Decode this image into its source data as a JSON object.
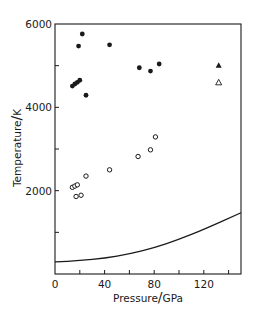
{
  "chart_data": {
    "type": "scatter",
    "title": "",
    "xlabel": "Pressure/GPa",
    "ylabel": "Temperature/K",
    "xlim": [
      0,
      150
    ],
    "ylim": [
      0,
      6000
    ],
    "x_ticks_major": [
      0,
      40,
      80,
      120
    ],
    "x_ticks_minor": [
      20,
      60,
      100,
      140
    ],
    "y_ticks_major": [
      2000,
      4000,
      6000
    ],
    "y_ticks_minor": [
      1000,
      3000,
      5000
    ],
    "grid": false,
    "legend": null,
    "series": [
      {
        "name": "filled circles",
        "marker": "filled-circle",
        "points": [
          {
            "x": 22,
            "y": 5760
          },
          {
            "x": 19,
            "y": 5470
          },
          {
            "x": 44,
            "y": 5500
          },
          {
            "x": 14,
            "y": 4510
          },
          {
            "x": 16,
            "y": 4560
          },
          {
            "x": 18,
            "y": 4600
          },
          {
            "x": 20,
            "y": 4650
          },
          {
            "x": 25,
            "y": 4290
          },
          {
            "x": 68,
            "y": 4950
          },
          {
            "x": 77,
            "y": 4870
          },
          {
            "x": 84,
            "y": 5040
          }
        ]
      },
      {
        "name": "open circles",
        "marker": "open-circle",
        "points": [
          {
            "x": 81,
            "y": 3290
          },
          {
            "x": 77,
            "y": 2980
          },
          {
            "x": 67,
            "y": 2820
          },
          {
            "x": 44,
            "y": 2500
          },
          {
            "x": 25,
            "y": 2350
          },
          {
            "x": 14,
            "y": 2080
          },
          {
            "x": 16,
            "y": 2110
          },
          {
            "x": 18,
            "y": 2140
          },
          {
            "x": 17,
            "y": 1860
          },
          {
            "x": 21,
            "y": 1890
          }
        ]
      },
      {
        "name": "filled triangle",
        "marker": "filled-triangle",
        "points": [
          {
            "x": 132,
            "y": 5010
          }
        ]
      },
      {
        "name": "open triangle",
        "marker": "open-triangle",
        "points": [
          {
            "x": 132,
            "y": 4600
          }
        ]
      },
      {
        "name": "curve",
        "marker": "line",
        "points": [
          {
            "x": 0,
            "y": 290
          },
          {
            "x": 20,
            "y": 320
          },
          {
            "x": 40,
            "y": 380
          },
          {
            "x": 60,
            "y": 480
          },
          {
            "x": 80,
            "y": 630
          },
          {
            "x": 100,
            "y": 830
          },
          {
            "x": 120,
            "y": 1070
          },
          {
            "x": 150,
            "y": 1470
          }
        ]
      }
    ]
  },
  "axes": {
    "x_label_left": "Pressure",
    "x_label_right": "GPa",
    "y_label_left": "Temperature",
    "y_label_right": "K",
    "x_tick_labels": [
      "0",
      "40",
      "80",
      "120"
    ],
    "y_tick_labels": [
      "2000",
      "4000",
      "6000"
    ]
  }
}
